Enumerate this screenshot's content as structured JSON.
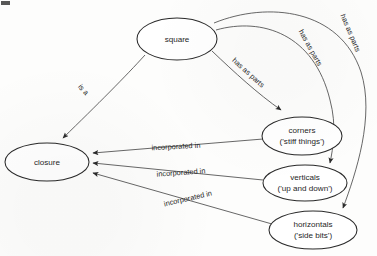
{
  "diagram": {
    "nodes": [
      {
        "id": "square",
        "label": "square",
        "sublabel": "",
        "cx": 177,
        "cy": 39,
        "rx": 40,
        "ry": 21
      },
      {
        "id": "closure",
        "label": "closure",
        "sublabel": "",
        "cx": 47,
        "cy": 162,
        "rx": 42,
        "ry": 19
      },
      {
        "id": "corners",
        "label": "corners",
        "sublabel": "('stiff things')",
        "cx": 302,
        "cy": 136,
        "rx": 40,
        "ry": 19
      },
      {
        "id": "verticals",
        "label": "verticals",
        "sublabel": "('up and down')",
        "cx": 305,
        "cy": 183,
        "rx": 42,
        "ry": 18
      },
      {
        "id": "horizontals",
        "label": "horizontals",
        "sublabel": "('side bits')",
        "cx": 313,
        "cy": 230,
        "rx": 44,
        "ry": 19
      }
    ],
    "edges": [
      {
        "id": "square-closure",
        "from": "square",
        "to": "closure",
        "label": "is a",
        "label_x": 83,
        "label_y": 90,
        "label_rotate": 48
      },
      {
        "id": "square-corners",
        "from": "square",
        "to": "corners",
        "label": "has as parts",
        "label_x": 248,
        "label_y": 73,
        "label_rotate": 42
      },
      {
        "id": "square-verticals",
        "from": "square",
        "to": "verticals",
        "label": "has as parts",
        "label_x": 310,
        "label_y": 48,
        "label_rotate": 61
      },
      {
        "id": "square-horizontals",
        "from": "square",
        "to": "horizontals",
        "label": "has as parts",
        "label_x": 350,
        "label_y": 33,
        "label_rotate": 67
      },
      {
        "id": "corners-closure",
        "from": "corners",
        "to": "closure",
        "label": "incorporated in",
        "label_x": 176,
        "label_y": 147,
        "label_rotate": -3
      },
      {
        "id": "verticals-closure",
        "from": "verticals",
        "to": "closure",
        "label": "incorporated in",
        "label_x": 181,
        "label_y": 173,
        "label_rotate": -4
      },
      {
        "id": "horizontals-closure",
        "from": "horizontals",
        "to": "closure",
        "label": "incorporated in",
        "label_x": 188,
        "label_y": 199,
        "label_rotate": -13
      }
    ]
  }
}
